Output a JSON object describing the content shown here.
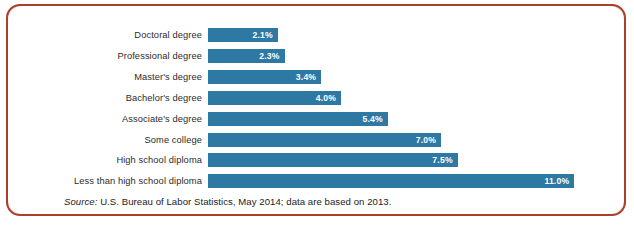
{
  "figure": {
    "frame_color": "#a8412c",
    "bar_color": "#2d79a4",
    "value_label_color": "#ffffff",
    "category_label_color": "#2b2b2b"
  },
  "source": {
    "prefix": "Source:",
    "text": "U.S. Bureau of Labor Statistics, May 2014; data are based on 2013."
  },
  "chart_data": {
    "type": "bar",
    "orientation": "horizontal",
    "title": "",
    "subtitle": "",
    "xlabel": "",
    "ylabel": "",
    "grid": false,
    "legend": "none",
    "xlim": [
      0,
      11.0
    ],
    "unit": "%",
    "categories": [
      "Doctoral degree",
      "Professional degree",
      "Master's degree",
      "Bachelor's degree",
      "Associate's degree",
      "Some college",
      "High school diploma",
      "Less than high school diploma"
    ],
    "values": [
      2.1,
      2.3,
      3.4,
      4.0,
      5.4,
      7.0,
      7.5,
      11.0
    ],
    "value_labels": [
      "2.1%",
      "2.3%",
      "3.4%",
      "4.0%",
      "5.4%",
      "7.0%",
      "7.5%",
      "11.0%"
    ]
  }
}
